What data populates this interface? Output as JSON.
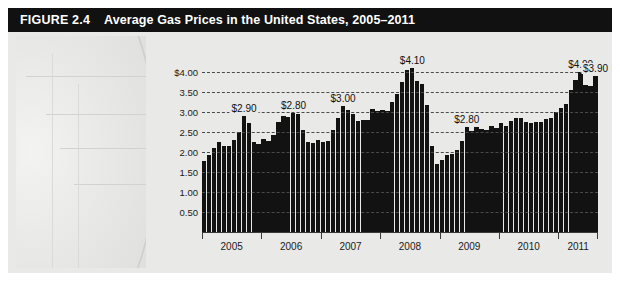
{
  "figure": {
    "number_label": "FIGURE 2.4",
    "title": "Average Gas Prices in the United States, 2005–2011"
  },
  "chart_data": {
    "type": "bar",
    "title": "Average Gas Prices in the United States, 2005–2011",
    "xlabel": "",
    "ylabel": "",
    "ylim": [
      0,
      4.25
    ],
    "grid": true,
    "legend": "none",
    "y_ticks": [
      "$4.00",
      "3.50",
      "3.00",
      "2.50",
      "2.00",
      "1.50",
      "1.00",
      "0.50"
    ],
    "y_tick_values": [
      4.0,
      3.5,
      3.0,
      2.5,
      2.0,
      1.5,
      1.0,
      0.5
    ],
    "x_tick_labels": [
      "2005",
      "2006",
      "2007",
      "2008",
      "2009",
      "2010",
      "2011"
    ],
    "categories": [
      "2005-01",
      "2005-02",
      "2005-03",
      "2005-04",
      "2005-05",
      "2005-06",
      "2005-07",
      "2005-08",
      "2005-09",
      "2005-10",
      "2005-11",
      "2005-12",
      "2006-01",
      "2006-02",
      "2006-03",
      "2006-04",
      "2006-05",
      "2006-06",
      "2006-07",
      "2006-08",
      "2006-09",
      "2006-10",
      "2006-11",
      "2006-12",
      "2007-01",
      "2007-02",
      "2007-03",
      "2007-04",
      "2007-05",
      "2007-06",
      "2007-07",
      "2007-08",
      "2007-09",
      "2007-10",
      "2007-11",
      "2007-12",
      "2008-01",
      "2008-02",
      "2008-03",
      "2008-04",
      "2008-05",
      "2008-06",
      "2008-07",
      "2008-08",
      "2008-09",
      "2008-10",
      "2008-11",
      "2008-12",
      "2009-01",
      "2009-02",
      "2009-03",
      "2009-04",
      "2009-05",
      "2009-06",
      "2009-07",
      "2009-08",
      "2009-09",
      "2009-10",
      "2009-11",
      "2009-12",
      "2010-01",
      "2010-02",
      "2010-03",
      "2010-04",
      "2010-05",
      "2010-06",
      "2010-07",
      "2010-08",
      "2010-09",
      "2010-10",
      "2010-11",
      "2010-12",
      "2011-01",
      "2011-02",
      "2011-03",
      "2011-04",
      "2011-05",
      "2011-06",
      "2011-07",
      "2011-08"
    ],
    "values": [
      1.78,
      1.92,
      2.1,
      2.24,
      2.16,
      2.16,
      2.29,
      2.49,
      2.9,
      2.72,
      2.26,
      2.19,
      2.32,
      2.28,
      2.42,
      2.74,
      2.9,
      2.88,
      2.98,
      2.95,
      2.56,
      2.25,
      2.23,
      2.31,
      2.24,
      2.28,
      2.56,
      2.86,
      3.15,
      3.05,
      2.96,
      2.78,
      2.79,
      2.79,
      3.07,
      3.02,
      3.04,
      3.03,
      3.25,
      3.46,
      3.76,
      4.05,
      4.1,
      3.78,
      3.7,
      3.17,
      2.15,
      1.7,
      1.79,
      1.92,
      1.95,
      2.06,
      2.27,
      2.63,
      2.53,
      2.62,
      2.57,
      2.55,
      2.65,
      2.61,
      2.73,
      2.66,
      2.78,
      2.85,
      2.84,
      2.74,
      2.73,
      2.75,
      2.75,
      2.82,
      2.86,
      3.01,
      3.1,
      3.21,
      3.56,
      3.81,
      4.0,
      3.68,
      3.65,
      3.9
    ],
    "annotations": [
      {
        "label": "$2.90",
        "at_category": "2005-09",
        "value": 2.9
      },
      {
        "label": "$2.80",
        "at_category": "2006-07",
        "value": 2.98
      },
      {
        "label": "$3.00",
        "at_category": "2007-05",
        "value": 3.15
      },
      {
        "label": "$4.10",
        "at_category": "2008-07",
        "value": 4.1
      },
      {
        "label": "$2.80",
        "at_category": "2009-06",
        "value": 2.63
      },
      {
        "label": "$4.00",
        "at_category": "2011-05",
        "value": 4.0
      },
      {
        "label": "$3.90",
        "at_category": "2011-08",
        "value": 3.9
      }
    ]
  },
  "colors": {
    "title_bar": "#111111",
    "title_text": "#ffffff",
    "panel": "#e9e9e7",
    "bar": "#121212",
    "gridline": "#4a4a4a",
    "axis": "#3a3a3a"
  }
}
